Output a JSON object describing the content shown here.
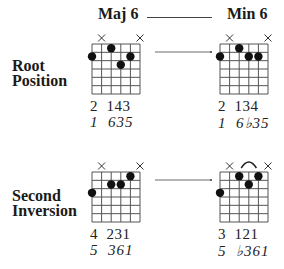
{
  "headings": {
    "left": "Maj 6",
    "right": "Min 6"
  },
  "rows": [
    {
      "label_line1": "Root",
      "label_line2": "Position",
      "major": {
        "muted_strings": [
          2,
          6
        ],
        "dots": [
          {
            "string": 1,
            "fret": 2
          },
          {
            "string": 3,
            "fret": 1
          },
          {
            "string": 4,
            "fret": 3
          },
          {
            "string": 5,
            "fret": 2
          }
        ],
        "fingering": "2  143",
        "degrees": "1  635"
      },
      "minor": {
        "muted_strings": [
          2,
          6
        ],
        "dots": [
          {
            "string": 1,
            "fret": 2
          },
          {
            "string": 3,
            "fret": 1
          },
          {
            "string": 4,
            "fret": 2
          },
          {
            "string": 5,
            "fret": 2
          }
        ],
        "fingering": "2  134",
        "degrees": "1  6♭35"
      }
    },
    {
      "label_line1": "Second",
      "label_line2": "Inversion",
      "major": {
        "muted_strings": [
          2,
          6
        ],
        "dots": [
          {
            "string": 1,
            "fret": 3
          },
          {
            "string": 3,
            "fret": 2
          },
          {
            "string": 4,
            "fret": 2
          },
          {
            "string": 5,
            "fret": 1
          }
        ],
        "fingering": "4  231",
        "degrees": "5  361"
      },
      "minor": {
        "muted_strings": [
          2,
          6
        ],
        "barre": {
          "from_string": 3,
          "to_string": 5
        },
        "dots": [
          {
            "string": 1,
            "fret": 3
          },
          {
            "string": 3,
            "fret": 1
          },
          {
            "string": 4,
            "fret": 2
          },
          {
            "string": 5,
            "fret": 1
          }
        ],
        "fingering": "3  121",
        "degrees": "5  ♭361"
      }
    }
  ],
  "diagram": {
    "strings": 6,
    "frets": 6,
    "line_color": "#555555",
    "dot_color": "#111111"
  }
}
